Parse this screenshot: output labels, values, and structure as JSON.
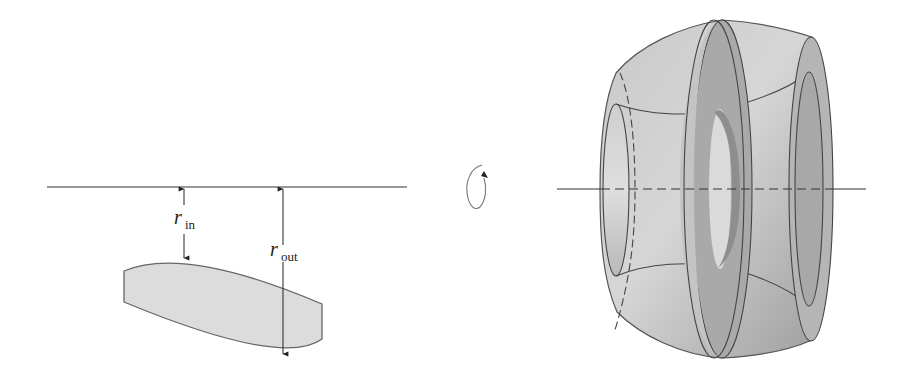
{
  "figure": {
    "left_panel": {
      "description": "Cross-section region below the axis of rotation",
      "axis_line": {
        "x1": 47,
        "x2": 407,
        "y": 187
      },
      "labels": {
        "r_in": {
          "main": "r",
          "sub": "in"
        },
        "r_out": {
          "main": "r",
          "sub": "out"
        }
      },
      "region_fill": "#dcdcdc",
      "stroke": "#555555"
    },
    "middle": {
      "rotation_icon": "rotation-arrow-icon"
    },
    "right_panel": {
      "description": "Solid of revolution (washer-shaped solid) with cut-away slice",
      "axis_line": {
        "x1": 557,
        "x2": 866,
        "y": 189
      },
      "body_color": "#b4b4b4",
      "stroke": "#444444"
    }
  }
}
